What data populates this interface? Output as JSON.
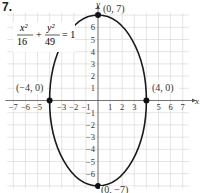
{
  "problem_number": "7.",
  "equation": {
    "x_num": "x²",
    "x_den": "16",
    "plus": "+",
    "y_num": "y²",
    "y_den": "49",
    "equals": "= 1"
  },
  "axes": {
    "x_label": "x",
    "y_label": "y",
    "x_ticks": [
      "−7",
      "−6",
      "−5",
      "−3",
      "−2",
      "−1",
      "1",
      "2",
      "3",
      "5",
      "6",
      "7"
    ],
    "x_tick_values": [
      -7,
      -6,
      -5,
      -3,
      -2,
      -1,
      1,
      2,
      3,
      5,
      6,
      7
    ],
    "y_ticks": [
      "6",
      "5",
      "4",
      "3",
      "2",
      "1",
      "−1",
      "−2",
      "−3",
      "−4",
      "−5",
      "−6"
    ],
    "y_tick_values": [
      6,
      5,
      4,
      3,
      2,
      1,
      -1,
      -2,
      -3,
      -4,
      -5,
      -6
    ]
  },
  "points": [
    {
      "label": "(0, 7)",
      "x": 0,
      "y": 7
    },
    {
      "label": "(−4, 0)",
      "x": -4,
      "y": 0
    },
    {
      "label": "(4, 0)",
      "x": 4,
      "y": 0
    },
    {
      "label": "(0, −7)",
      "x": 0,
      "y": -7
    }
  ],
  "colors": {
    "grid": "#d4d4d4",
    "axis": "#555555",
    "curve": "#1a1a1a",
    "point": "#111111",
    "text": "#333333"
  },
  "chart_data": {
    "type": "line",
    "title": "",
    "subtitle": "x^2/16 + y^2/49 = 1",
    "xlabel": "x",
    "ylabel": "y",
    "xlim": [
      -7.5,
      7.5
    ],
    "ylim": [
      -7.2,
      7.2
    ],
    "grid": true,
    "legend": null,
    "series": [
      {
        "name": "ellipse x^2/16 + y^2/49 = 1",
        "shape": "ellipse",
        "center": [
          0,
          0
        ],
        "semi_axis_x": 4,
        "semi_axis_y": 7
      }
    ],
    "annotations": [
      {
        "text": "(0, 7)",
        "x": 0,
        "y": 7
      },
      {
        "text": "(−4, 0)",
        "x": -4,
        "y": 0
      },
      {
        "text": "(4, 0)",
        "x": 4,
        "y": 0
      },
      {
        "text": "(0, −7)",
        "x": 0,
        "y": -7
      }
    ]
  }
}
